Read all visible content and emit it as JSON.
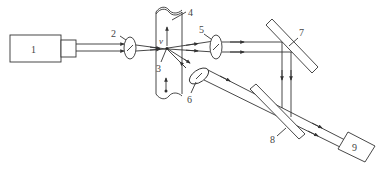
{
  "diagram": {
    "type": "optical-setup",
    "components": [
      {
        "id": "1",
        "label": "1",
        "name": "laser-source"
      },
      {
        "id": "2",
        "label": "2",
        "name": "focusing-lens"
      },
      {
        "id": "3",
        "label": "3",
        "name": "measurement-point"
      },
      {
        "id": "4",
        "label": "4",
        "name": "flow-tube"
      },
      {
        "id": "5",
        "label": "5",
        "name": "collimating-lens"
      },
      {
        "id": "6",
        "label": "6",
        "name": "collimating-lens-scatter"
      },
      {
        "id": "7",
        "label": "7",
        "name": "mirror"
      },
      {
        "id": "8",
        "label": "8",
        "name": "beam-splitter"
      },
      {
        "id": "9",
        "label": "9",
        "name": "detector"
      }
    ],
    "velocity_label": "v"
  }
}
